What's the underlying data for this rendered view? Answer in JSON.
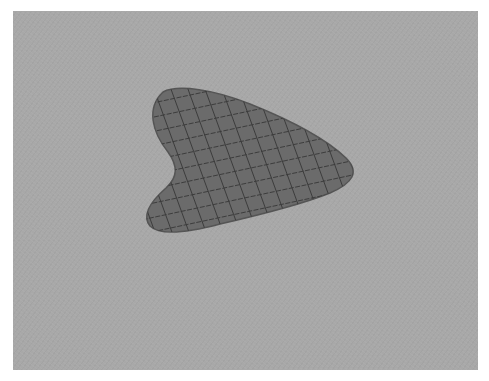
{
  "scene": {
    "background_color": "#ffffff",
    "panel_color": "#a8a8a8",
    "shape": {
      "description": "rounded heart/boomerang-shaped blob with crosshatched grid",
      "fill_color": "#6b6b6b",
      "edge_color": "#555555",
      "grid_color": "#3c3c3c"
    }
  },
  "caption": {
    "text": ""
  }
}
